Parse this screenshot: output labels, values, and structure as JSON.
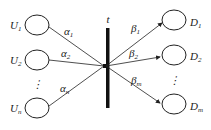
{
  "diagram": {
    "center_label": "t",
    "sources": [
      {
        "name": "U",
        "sub": "1",
        "edge_name": "α",
        "edge_sub": "1"
      },
      {
        "name": "U",
        "sub": "2",
        "edge_name": "α",
        "edge_sub": "2"
      },
      {
        "name": "U",
        "sub": "n",
        "edge_name": "α",
        "edge_sub": "n"
      }
    ],
    "destinations": [
      {
        "name": "D",
        "sub": "1",
        "edge_name": "β",
        "edge_sub": "1"
      },
      {
        "name": "D",
        "sub": "2",
        "edge_name": "β",
        "edge_sub": "2"
      },
      {
        "name": "D",
        "sub": "m",
        "edge_name": "β",
        "edge_sub": "m"
      }
    ],
    "ellipsis": "⋮"
  }
}
